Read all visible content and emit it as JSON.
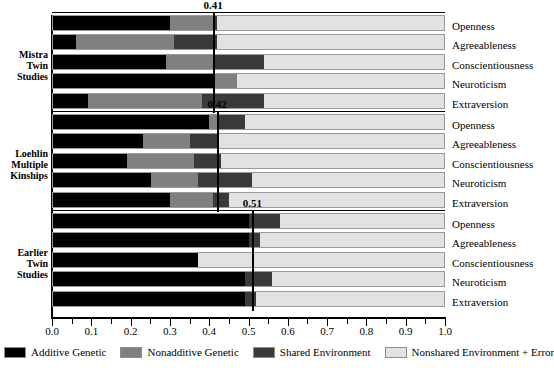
{
  "chart_data": {
    "type": "bar",
    "subtype": "stacked-horizontal-grouped",
    "title": "",
    "xlabel": "",
    "ylabel": "",
    "xlim": [
      0.0,
      1.0
    ],
    "grid": false,
    "legend_position": "bottom",
    "xticks": [
      "0.0",
      "0.1",
      "0.2",
      "0.3",
      "0.4",
      "0.5",
      "0.6",
      "0.7",
      "0.8",
      "0.9",
      "1.0"
    ],
    "xtick_values": [
      0.0,
      0.1,
      0.2,
      0.3,
      0.4,
      0.5,
      0.6,
      0.7,
      0.8,
      0.9,
      1.0
    ],
    "series": [
      {
        "name": "Additive Genetic",
        "color": "#000000"
      },
      {
        "name": "Nonadditive Genetic",
        "color": "#808080"
      },
      {
        "name": "Shared Environment",
        "color": "#3a3a3a"
      },
      {
        "name": "Nonshared Environment + Error",
        "color": "#e2e2e2"
      }
    ],
    "categories": [
      "Openness",
      "Agreeableness",
      "Conscientiousness",
      "Neuroticism",
      "Extraversion"
    ],
    "groups": [
      {
        "label_lines": [
          "Mistra",
          "Twin",
          "Studies"
        ],
        "mean": 0.41,
        "mean_label": "0.41",
        "rows": [
          {
            "trait": "Openness",
            "values": [
              0.3,
              0.11,
              0.01,
              0.58
            ]
          },
          {
            "trait": "Agreeableness",
            "values": [
              0.06,
              0.25,
              0.11,
              0.58
            ]
          },
          {
            "trait": "Conscientiousness",
            "values": [
              0.29,
              0.12,
              0.13,
              0.46
            ]
          },
          {
            "trait": "Neuroticism",
            "values": [
              0.41,
              0.06,
              0.0,
              0.53
            ]
          },
          {
            "trait": "Extraversion",
            "values": [
              0.09,
              0.29,
              0.16,
              0.46
            ]
          }
        ]
      },
      {
        "label_lines": [
          "Loehlin",
          "Multiple",
          "Kinships"
        ],
        "mean": 0.42,
        "mean_label": "0.42",
        "rows": [
          {
            "trait": "Openness",
            "values": [
              0.4,
              0.02,
              0.07,
              0.51
            ]
          },
          {
            "trait": "Agreeableness",
            "values": [
              0.23,
              0.12,
              0.07,
              0.58
            ]
          },
          {
            "trait": "Conscientiousness",
            "values": [
              0.19,
              0.17,
              0.07,
              0.57
            ]
          },
          {
            "trait": "Neuroticism",
            "values": [
              0.25,
              0.12,
              0.14,
              0.49
            ]
          },
          {
            "trait": "Extraversion",
            "values": [
              0.3,
              0.11,
              0.04,
              0.55
            ]
          }
        ]
      },
      {
        "label_lines": [
          "Earlier",
          "Twin",
          "Studies"
        ],
        "mean": 0.51,
        "mean_label": "0.51",
        "rows": [
          {
            "trait": "Openness",
            "values": [
              0.5,
              0.0,
              0.08,
              0.42
            ]
          },
          {
            "trait": "Agreeableness",
            "values": [
              0.5,
              0.0,
              0.03,
              0.47
            ]
          },
          {
            "trait": "Conscientiousness",
            "values": [
              0.37,
              0.0,
              0.0,
              0.63
            ]
          },
          {
            "trait": "Neuroticism",
            "values": [
              0.49,
              0.0,
              0.07,
              0.44
            ]
          },
          {
            "trait": "Extraversion",
            "values": [
              0.49,
              0.0,
              0.03,
              0.48
            ]
          }
        ]
      }
    ]
  }
}
